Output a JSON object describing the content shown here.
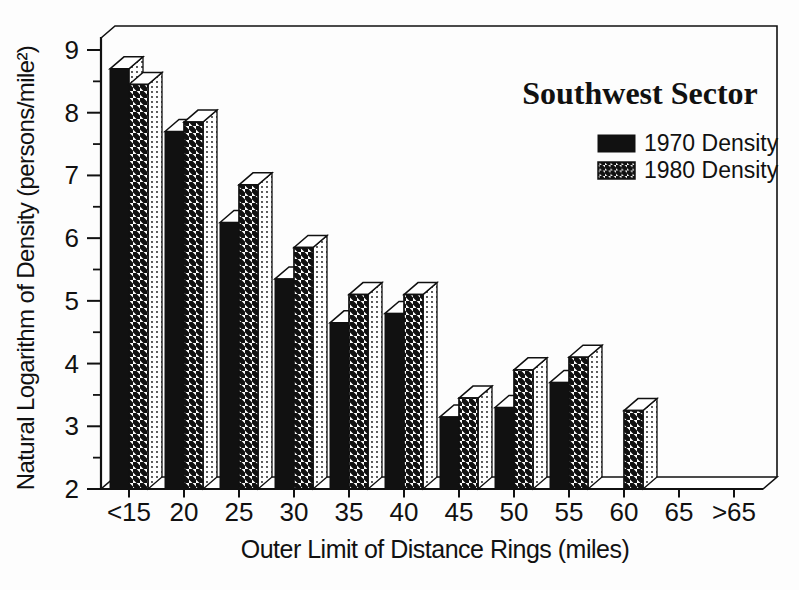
{
  "chart_data": {
    "type": "bar",
    "style": "3d-grouped-columns",
    "title": "Southwest Sector",
    "xlabel": "Outer Limit of Distance Rings (miles)",
    "ylabel": "Natural Logarithm of Density (persons/mile²)",
    "categories": [
      "<15",
      "20",
      "25",
      "30",
      "35",
      "40",
      "45",
      "50",
      "55",
      "60",
      "65",
      ">65"
    ],
    "series": [
      {
        "name": "1970 Density",
        "swatch": "solid-black",
        "values": [
          8.7,
          7.7,
          6.25,
          5.35,
          4.65,
          4.8,
          3.15,
          3.3,
          3.7,
          null,
          null,
          null
        ]
      },
      {
        "name": "1980 Density",
        "swatch": "diagonal-hatch",
        "values": [
          8.45,
          7.85,
          6.85,
          5.85,
          5.1,
          5.1,
          3.45,
          3.9,
          4.1,
          3.25,
          null,
          null
        ]
      }
    ],
    "ylim": [
      2,
      9
    ],
    "yticks": [
      2,
      3,
      4,
      5,
      6,
      7,
      8,
      9
    ],
    "yminor_step": 0.5,
    "grid": false,
    "legend_position": "upper-right",
    "colors": {
      "foreground": "#111111",
      "background": "#ffffff"
    }
  }
}
